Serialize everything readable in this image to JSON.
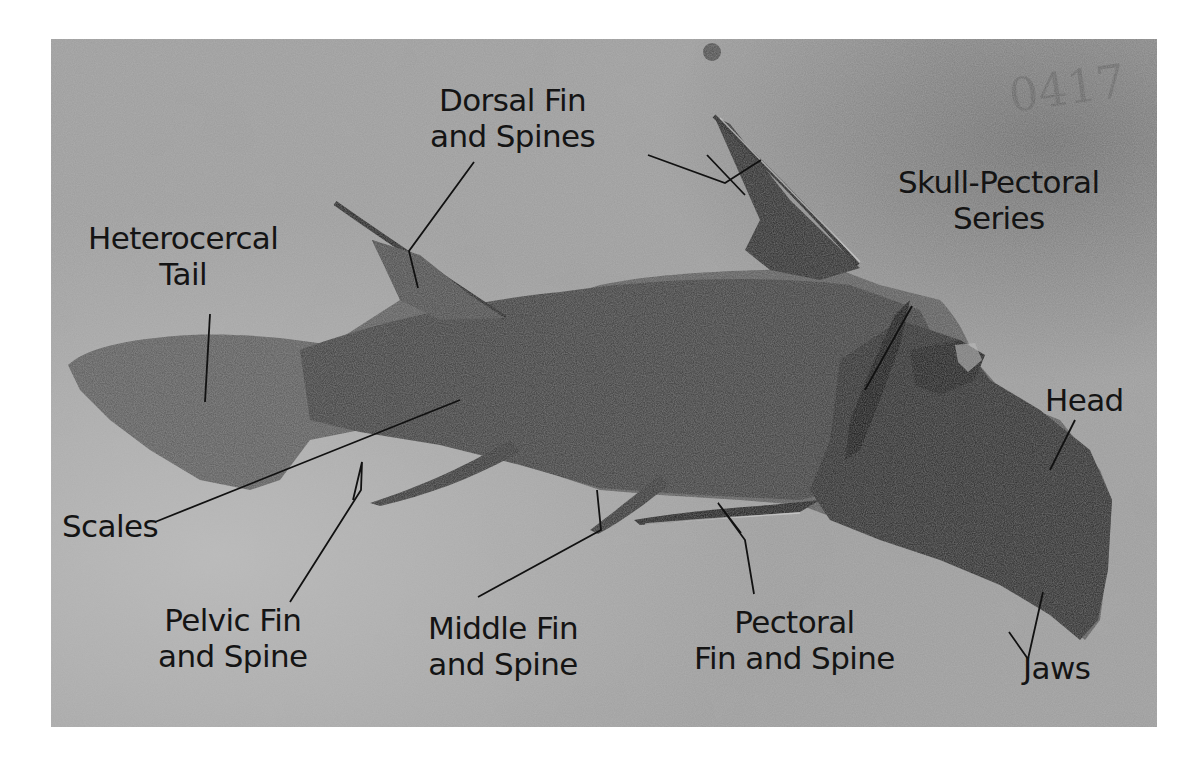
{
  "figure": {
    "colors": {
      "matrix": "#9a9a9a",
      "matrix_light": "#b4b4b4",
      "fossil_body": "#3e3e3e",
      "fossil_dark": "#1a1a1a",
      "label_text": "#141414",
      "leader_line": "#111111",
      "page_background": "#ffffff"
    },
    "specimen_number": "0417"
  },
  "labels": {
    "dorsal": {
      "line1": "Dorsal Fin",
      "line2": "and Spines"
    },
    "skull": {
      "line1": "Skull-Pectoral",
      "line2": "Series"
    },
    "tail": {
      "line1": "Heterocercal",
      "line2": "Tail"
    },
    "head": {
      "line1": "Head"
    },
    "scales": {
      "line1": "Scales"
    },
    "pelvic": {
      "line1": "Pelvic Fin",
      "line2": "and Spine"
    },
    "middle": {
      "line1": "Middle Fin",
      "line2": "and Spine"
    },
    "pectoral": {
      "line1": "Pectoral",
      "line2": "Fin and Spine"
    },
    "jaws": {
      "line1": "Jaws"
    }
  }
}
